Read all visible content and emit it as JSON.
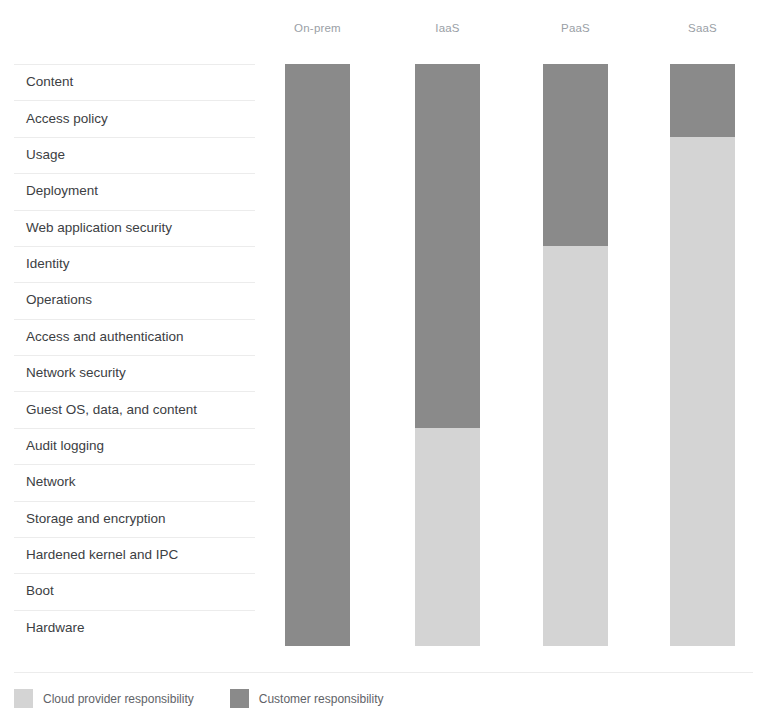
{
  "chart_data": {
    "type": "bar",
    "title": "",
    "subtitle": "",
    "xlabel": "",
    "ylabel": "",
    "orientation": "vertical",
    "stacked": true,
    "grid": false,
    "legend_position": "bottom-left",
    "categories": [
      "On-prem",
      "IaaS",
      "PaaS",
      "SaaS"
    ],
    "row_labels": [
      "Content",
      "Access policy",
      "Usage",
      "Deployment",
      "Web application security",
      "Identity",
      "Operations",
      "Access and authentication",
      "Network security",
      "Guest OS, data, and content",
      "Audit logging",
      "Network",
      "Storage and encryption",
      "Hardened kernel and IPC",
      "Boot",
      "Hardware"
    ],
    "total_rows": 16,
    "series": [
      {
        "name": "Customer responsibility",
        "color": "#8a8a8a",
        "values": [
          16,
          10,
          5,
          2
        ]
      },
      {
        "name": "Cloud provider responsibility",
        "color": "#d4d4d4",
        "values": [
          0,
          6,
          11,
          14
        ]
      }
    ],
    "stacks": [
      {
        "category": "On-prem",
        "customer_rows": 16,
        "provider_rows": 0,
        "customer_first_row": "Content",
        "customer_last_row": "Hardware",
        "provider_first_row": "",
        "provider_last_row": ""
      },
      {
        "category": "IaaS",
        "customer_rows": 10,
        "provider_rows": 6,
        "customer_first_row": "Content",
        "customer_last_row": "Guest OS, data, and content",
        "provider_first_row": "Audit logging",
        "provider_last_row": "Hardware"
      },
      {
        "category": "PaaS",
        "customer_rows": 5,
        "provider_rows": 11,
        "customer_first_row": "Content",
        "customer_last_row": "Web application security",
        "provider_first_row": "Identity",
        "provider_last_row": "Hardware"
      },
      {
        "category": "SaaS",
        "customer_rows": 2,
        "provider_rows": 14,
        "customer_first_row": "Content",
        "customer_last_row": "Access policy",
        "provider_first_row": "Usage",
        "provider_last_row": "Hardware"
      }
    ]
  },
  "legend": {
    "items": [
      {
        "label": "Cloud provider responsibility",
        "color": "#d4d4d4"
      },
      {
        "label": "Customer responsibility",
        "color": "#8a8a8a"
      }
    ]
  },
  "colors": {
    "customer": "#8a8a8a",
    "provider": "#d4d4d4",
    "row_separator": "#ececec",
    "header_text": "#9aa0a6",
    "label_text": "#3c4043",
    "legend_text": "#5f6368",
    "background": "#ffffff"
  }
}
